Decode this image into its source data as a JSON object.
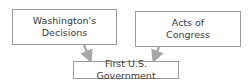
{
  "diagram": {
    "type": "flow",
    "nodes": [
      {
        "id": "washington",
        "label_line1": "Washington's",
        "label_line2": "Decisions"
      },
      {
        "id": "congress",
        "label_line1": "Acts of",
        "label_line2": "Congress"
      },
      {
        "id": "government",
        "label": "First U.S. Government"
      }
    ],
    "edges": [
      {
        "from": "washington",
        "to": "government"
      },
      {
        "from": "congress",
        "to": "government"
      }
    ],
    "colors": {
      "border": "#9a9a9a",
      "arrow": "#a8a8a8",
      "text": "#3a3a3a"
    }
  }
}
